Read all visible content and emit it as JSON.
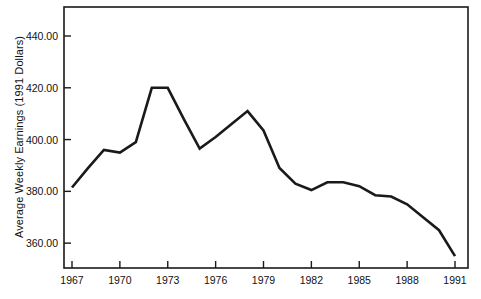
{
  "chart_data": {
    "type": "line",
    "title": "",
    "xlabel": "",
    "ylabel": "Average Weekly Earnings (1991 Dollars)",
    "x": [
      1967,
      1968,
      1969,
      1970,
      1971,
      1972,
      1973,
      1974,
      1975,
      1976,
      1977,
      1978,
      1979,
      1980,
      1981,
      1982,
      1983,
      1984,
      1985,
      1986,
      1987,
      1988,
      1989,
      1990,
      1991
    ],
    "values": [
      381.5,
      389.0,
      396.0,
      395.0,
      399.0,
      420.0,
      420.0,
      408.0,
      396.5,
      401.0,
      406.0,
      411.0,
      403.5,
      389.0,
      383.0,
      380.5,
      383.5,
      383.5,
      382.0,
      378.5,
      378.0,
      375.0,
      370.0,
      365.0,
      355.0
    ],
    "series": [
      {
        "name": "Average Weekly Earnings (1991 Dollars)",
        "values": [
          381.5,
          389.0,
          396.0,
          395.0,
          399.0,
          420.0,
          420.0,
          408.0,
          396.5,
          401.0,
          406.0,
          411.0,
          403.5,
          389.0,
          383.0,
          380.5,
          383.5,
          383.5,
          382.0,
          378.5,
          378.0,
          375.0,
          370.0,
          365.0,
          355.0
        ],
        "color": "#1a1a1a"
      }
    ],
    "xlim": [
      1967,
      1991
    ],
    "ylim": [
      350.4,
      451.2
    ],
    "grid": false,
    "legend": null,
    "legend_position": "none",
    "y_ticks": [
      360.0,
      380.0,
      400.0,
      420.0,
      440.0
    ],
    "y_tick_labels": [
      "360.00",
      "380.00",
      "400.00",
      "420.00",
      "440.00"
    ],
    "x_ticks": [
      1967,
      1970,
      1973,
      1976,
      1979,
      1982,
      1985,
      1988,
      1991
    ],
    "x_tick_labels": [
      "1967",
      "1970",
      "1973",
      "1976",
      "1979",
      "1982",
      "1985",
      "1988",
      "1991"
    ],
    "line_color": "#1a1a1a",
    "frame_color": "#1a1a1a"
  },
  "layout": {
    "plot_left": 64,
    "plot_right": 468,
    "plot_top": 7,
    "plot_bottom": 268,
    "x_first_tick": 72,
    "x_last_tick": 455
  }
}
